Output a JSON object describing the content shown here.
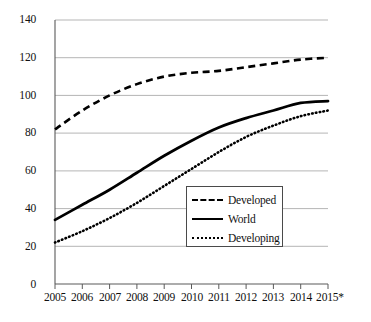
{
  "chart_data": {
    "type": "line",
    "title": "",
    "subtitle": "",
    "xlabel": "",
    "ylabel": "",
    "x": [
      "2005",
      "2006",
      "2007",
      "2008",
      "2009",
      "2010",
      "2011",
      "2012",
      "2013",
      "2014",
      "2015*"
    ],
    "categories": [
      "2005",
      "2006",
      "2007",
      "2008",
      "2009",
      "2010",
      "2011",
      "2012",
      "2013",
      "2014",
      "2015*"
    ],
    "ylim": [
      0,
      140
    ],
    "yticks": [
      0,
      20,
      40,
      60,
      80,
      100,
      120,
      140
    ],
    "ytick_labels": [
      "0",
      "20",
      "40",
      "60",
      "80",
      "100",
      "120",
      "140"
    ],
    "grid": "horizontal",
    "legend_position": "inside-lower-right",
    "series": [
      {
        "name": "Developed",
        "style": "dashed",
        "color": "#000000",
        "values": [
          82,
          92,
          100,
          106,
          110,
          112,
          113,
          115,
          117,
          119,
          120
        ]
      },
      {
        "name": "World",
        "style": "solid",
        "color": "#000000",
        "values": [
          34,
          42,
          50,
          59,
          68,
          76,
          83,
          88,
          92,
          96,
          97
        ]
      },
      {
        "name": "Developing",
        "style": "dotted",
        "color": "#000000",
        "values": [
          22,
          28,
          35,
          43,
          52,
          61,
          70,
          78,
          84,
          89,
          92
        ]
      }
    ],
    "annotations": [
      {
        "text": "2015*",
        "note": "asterisk denotes estimate"
      }
    ]
  },
  "legend": {
    "items": [
      {
        "label": "Developed",
        "sample": "dashed-line-sample"
      },
      {
        "label": "World",
        "sample": "solid-line-sample"
      },
      {
        "label": "Developing",
        "sample": "dotted-line-sample"
      }
    ]
  }
}
